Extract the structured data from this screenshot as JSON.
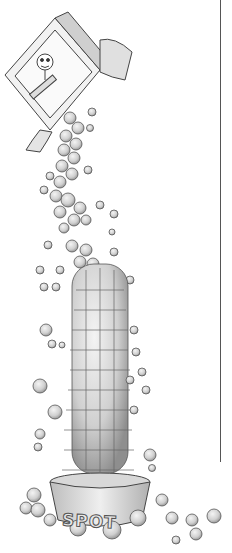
{
  "illustration": {
    "subject": "box of kibble pouring into a pet food bowl",
    "bowl_label": "SPOT",
    "colors": {
      "background": "#ffffff",
      "outline": "#444444",
      "kibble_light": "#e6e6e6",
      "kibble_shade": "#9a9a9a",
      "rule_line": "#555555"
    }
  }
}
